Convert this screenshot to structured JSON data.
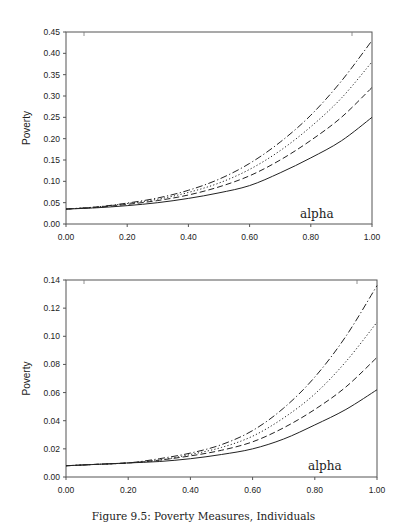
{
  "chart_data": [
    {
      "type": "line",
      "title": "",
      "xlabel": "",
      "ylabel": "Poverty",
      "annotation": "alpha",
      "xlim": [
        0,
        1
      ],
      "ylim": [
        0,
        0.45
      ],
      "x_ticks": [
        "0.00",
        "0.20",
        "0.40",
        "0.60",
        "0.80",
        "1.00"
      ],
      "y_ticks": [
        "0.00",
        "0.05",
        "0.10",
        "0.15",
        "0.20",
        "0.25",
        "0.30",
        "0.35",
        "0.40",
        "0.45"
      ],
      "grid": false,
      "legend": null,
      "x": [
        0.0,
        0.1,
        0.2,
        0.3,
        0.4,
        0.5,
        0.6,
        0.7,
        0.8,
        0.9,
        1.0
      ],
      "series": [
        {
          "name": "solid",
          "style": "solid",
          "values": [
            0.035,
            0.038,
            0.043,
            0.05,
            0.06,
            0.073,
            0.09,
            0.12,
            0.155,
            0.195,
            0.25
          ]
        },
        {
          "name": "dashed",
          "style": "dashed",
          "values": [
            0.035,
            0.039,
            0.046,
            0.055,
            0.068,
            0.087,
            0.113,
            0.15,
            0.196,
            0.25,
            0.32
          ]
        },
        {
          "name": "dotted",
          "style": "dotted",
          "values": [
            0.035,
            0.04,
            0.048,
            0.058,
            0.074,
            0.096,
            0.128,
            0.172,
            0.228,
            0.295,
            0.38
          ]
        },
        {
          "name": "dash-dot",
          "style": "dashdot",
          "values": [
            0.035,
            0.04,
            0.049,
            0.061,
            0.079,
            0.105,
            0.142,
            0.192,
            0.255,
            0.335,
            0.43
          ]
        }
      ]
    },
    {
      "type": "line",
      "title": "",
      "xlabel": "",
      "ylabel": "Poverty",
      "annotation": "alpha",
      "xlim": [
        0,
        1
      ],
      "ylim": [
        0,
        0.14
      ],
      "x_ticks": [
        "0.00",
        "0.20",
        "0.40",
        "0.60",
        "0.80",
        "1.00"
      ],
      "y_ticks": [
        "0.00",
        "0.02",
        "0.04",
        "0.06",
        "0.08",
        "0.10",
        "0.12",
        "0.14"
      ],
      "grid": false,
      "legend": null,
      "x": [
        0.0,
        0.1,
        0.2,
        0.3,
        0.4,
        0.5,
        0.6,
        0.7,
        0.8,
        0.9,
        1.0
      ],
      "series": [
        {
          "name": "solid",
          "style": "solid",
          "values": [
            0.008,
            0.009,
            0.01,
            0.011,
            0.013,
            0.016,
            0.02,
            0.027,
            0.037,
            0.048,
            0.062
          ]
        },
        {
          "name": "dashed",
          "style": "dashed",
          "values": [
            0.008,
            0.009,
            0.01,
            0.012,
            0.015,
            0.019,
            0.025,
            0.035,
            0.048,
            0.064,
            0.085
          ]
        },
        {
          "name": "dotted",
          "style": "dotted",
          "values": [
            0.008,
            0.009,
            0.01,
            0.012,
            0.016,
            0.021,
            0.029,
            0.042,
            0.059,
            0.082,
            0.11
          ]
        },
        {
          "name": "dash-dot",
          "style": "dashdot",
          "values": [
            0.008,
            0.009,
            0.01,
            0.013,
            0.017,
            0.023,
            0.033,
            0.049,
            0.071,
            0.1,
            0.136
          ]
        }
      ]
    }
  ],
  "caption": "Figure 9.5: Poverty Measures, Individuals"
}
